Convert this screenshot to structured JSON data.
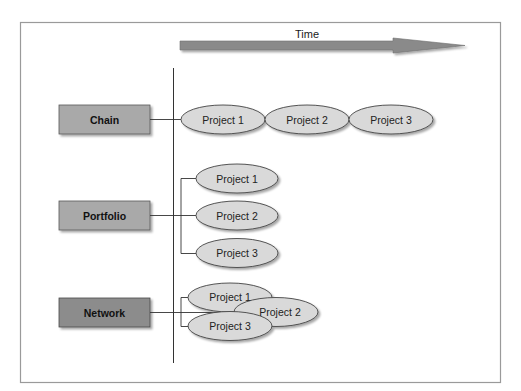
{
  "diagram": {
    "axis_label": "Time",
    "categories": [
      {
        "label": "Chain",
        "fill": "#a9a9a9"
      },
      {
        "label": "Portfolio",
        "fill": "#a9a9a9"
      },
      {
        "label": "Network",
        "fill": "#8c8c8c"
      }
    ],
    "chain_projects": [
      "Project 1",
      "Project 2",
      "Project 3"
    ],
    "portfolio_projects": [
      "Project 1",
      "Project 2",
      "Project 3"
    ],
    "network_projects": [
      "Project 1",
      "Project 2",
      "Project 3"
    ],
    "colors": {
      "ellipse_fill": "#d9d9d9",
      "arrow_fill": "#8a8a8a",
      "border": "#9a9a9a"
    }
  }
}
